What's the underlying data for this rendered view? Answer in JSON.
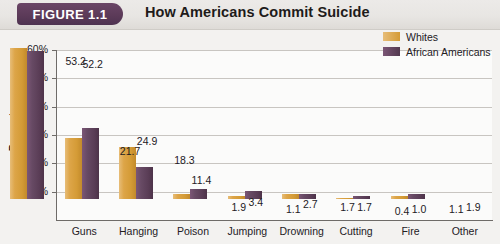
{
  "header": {
    "badge_label": "FIGURE 1.1",
    "title": "How Americans Commit Suicide",
    "badge_color": "#5b3a58"
  },
  "legend": {
    "position": "top-right",
    "items": [
      {
        "label": "Whites",
        "color": "#d49b36",
        "swatch_name": "legend-swatch-whites"
      },
      {
        "label": "African Americans",
        "color": "#5a3d56",
        "swatch_name": "legend-swatch-african-americans"
      }
    ]
  },
  "chart_data": {
    "type": "bar",
    "title": "How Americans Commit Suicide",
    "xlabel": "",
    "ylabel": "Percentage",
    "ylim": [
      0,
      60
    ],
    "yticks": [
      "10%",
      "20%",
      "30%",
      "40%",
      "50%",
      "60%"
    ],
    "ytick_values": [
      10,
      20,
      30,
      40,
      50,
      60
    ],
    "grid": true,
    "categories": [
      "Guns",
      "Hanging",
      "Poison",
      "Jumping",
      "Drowning",
      "Cutting",
      "Fire",
      "Other"
    ],
    "series": [
      {
        "name": "Whites",
        "color": "#d49b36",
        "values": [
          53.2,
          21.7,
          18.3,
          1.9,
          1.1,
          1.7,
          0.4,
          1.1
        ]
      },
      {
        "name": "African Americans",
        "color": "#5a3d56",
        "values": [
          52.2,
          24.9,
          11.4,
          3.4,
          2.7,
          1.7,
          1.0,
          1.9
        ]
      }
    ],
    "data_labels": [
      [
        "53.2",
        "52.2"
      ],
      [
        "21.7",
        "24.9"
      ],
      [
        "18.3",
        "11.4"
      ],
      [
        "1.9",
        "3.4"
      ],
      [
        "1.1",
        "2.7"
      ],
      [
        "1.7",
        "1.7"
      ],
      [
        "0.4",
        "1.0"
      ],
      [
        "1.1",
        "1.9"
      ]
    ]
  }
}
